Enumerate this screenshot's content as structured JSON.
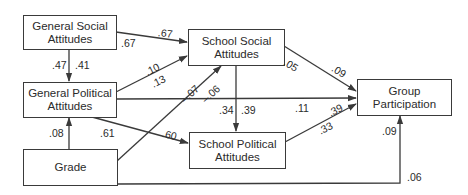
{
  "nodes": {
    "general_social": "General Social\nAttitudes",
    "general_political": "General Political\nAttitudes",
    "grade": "Grade",
    "school_social": "School Social\nAttitudes",
    "school_political": "School Political\nAttitudes",
    "group_participation": "Group\nParticipation"
  },
  "node_lines": {
    "general_social": [
      "General Social",
      "Attitudes"
    ],
    "general_political": [
      "General Political",
      "Attitudes"
    ],
    "grade": [
      "Grade"
    ],
    "school_social": [
      "School Social",
      "Attitudes"
    ],
    "school_political": [
      "School Political",
      "Attitudes"
    ],
    "group_participation": [
      "Group",
      "Participation"
    ]
  },
  "edges": [
    {
      "from": "general_social",
      "to": "school_social",
      "coefficients": [
        ".67",
        ".67"
      ]
    },
    {
      "from": "general_social",
      "to": "general_political",
      "coefficients": [
        ".47",
        ".41"
      ]
    },
    {
      "from": "general_political",
      "to": "school_social",
      "coefficients": [
        ".10",
        ".13"
      ]
    },
    {
      "from": "grade",
      "to": "school_social",
      "coefficients": [
        "–.07",
        "–.06"
      ]
    },
    {
      "from": "general_political",
      "to": "group_participation",
      "coefficients": [
        ".11"
      ]
    },
    {
      "from": "general_political",
      "to": "school_political",
      "coefficients": [
        ".61",
        ".60"
      ]
    },
    {
      "from": "grade",
      "to": "general_political",
      "coefficients": [
        ".08"
      ]
    },
    {
      "from": "school_social",
      "to": "school_political",
      "coefficients": [
        ".34",
        ".39"
      ]
    },
    {
      "from": "school_social",
      "to": "group_participation",
      "coefficients": [
        ".05",
        ".09"
      ]
    },
    {
      "from": "school_political",
      "to": "group_participation",
      "coefficients": [
        ".39",
        ".33"
      ]
    },
    {
      "from": "grade",
      "to": "group_participation",
      "coefficients": [
        ".09",
        ".06"
      ]
    }
  ],
  "colors": {
    "line": "#3a3a3a",
    "text": "#2b2b2b",
    "background": "#ffffff"
  }
}
